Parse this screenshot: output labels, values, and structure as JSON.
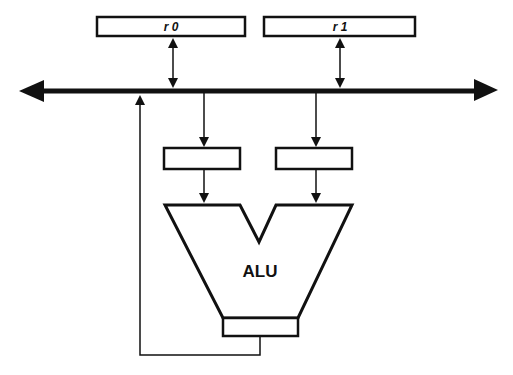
{
  "diagram": {
    "registers": [
      {
        "label": "r 0"
      },
      {
        "label": "r 1"
      }
    ],
    "alu": {
      "label": "ALU"
    },
    "colors": {
      "stroke": "#111111",
      "background": "#ffffff"
    }
  }
}
